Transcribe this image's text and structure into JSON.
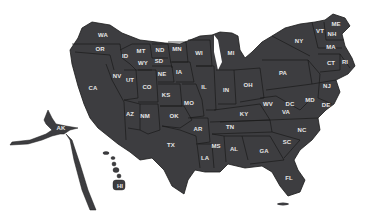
{
  "map": {
    "type": "cartogram",
    "region": "United States",
    "colors": {
      "state_fill": "#3d3d40",
      "border": "#1a1a1a",
      "label": "#e6e6e6",
      "background": "#ffffff"
    },
    "states": [
      {
        "abbr": "WA",
        "x": 103,
        "y": 35
      },
      {
        "abbr": "OR",
        "x": 100,
        "y": 49
      },
      {
        "abbr": "CA",
        "x": 93,
        "y": 88
      },
      {
        "abbr": "NV",
        "x": 117,
        "y": 76
      },
      {
        "abbr": "ID",
        "x": 125,
        "y": 56
      },
      {
        "abbr": "MT",
        "x": 141,
        "y": 51
      },
      {
        "abbr": "WY",
        "x": 143,
        "y": 63
      },
      {
        "abbr": "UT",
        "x": 130,
        "y": 80
      },
      {
        "abbr": "CO",
        "x": 147,
        "y": 87
      },
      {
        "abbr": "AZ",
        "x": 130,
        "y": 114
      },
      {
        "abbr": "NM",
        "x": 145,
        "y": 116
      },
      {
        "abbr": "ND",
        "x": 160,
        "y": 50
      },
      {
        "abbr": "SD",
        "x": 159,
        "y": 61
      },
      {
        "abbr": "NE",
        "x": 162,
        "y": 74
      },
      {
        "abbr": "KS",
        "x": 166,
        "y": 95
      },
      {
        "abbr": "OK",
        "x": 174,
        "y": 116
      },
      {
        "abbr": "TX",
        "x": 171,
        "y": 145
      },
      {
        "abbr": "MN",
        "x": 177,
        "y": 49
      },
      {
        "abbr": "IA",
        "x": 179,
        "y": 72
      },
      {
        "abbr": "MO",
        "x": 189,
        "y": 103
      },
      {
        "abbr": "AR",
        "x": 198,
        "y": 129
      },
      {
        "abbr": "LA",
        "x": 205,
        "y": 158
      },
      {
        "abbr": "WI",
        "x": 199,
        "y": 53
      },
      {
        "abbr": "IL",
        "x": 204,
        "y": 87
      },
      {
        "abbr": "MI",
        "x": 231,
        "y": 53
      },
      {
        "abbr": "IN",
        "x": 226,
        "y": 90
      },
      {
        "abbr": "OH",
        "x": 248,
        "y": 85
      },
      {
        "abbr": "KY",
        "x": 244,
        "y": 114
      },
      {
        "abbr": "TN",
        "x": 230,
        "y": 127
      },
      {
        "abbr": "MS",
        "x": 216,
        "y": 146
      },
      {
        "abbr": "AL",
        "x": 234,
        "y": 149
      },
      {
        "abbr": "GA",
        "x": 264,
        "y": 151
      },
      {
        "abbr": "FL",
        "x": 289,
        "y": 178
      },
      {
        "abbr": "SC",
        "x": 287,
        "y": 142
      },
      {
        "abbr": "NC",
        "x": 302,
        "y": 130
      },
      {
        "abbr": "VA",
        "x": 286,
        "y": 112
      },
      {
        "abbr": "WV",
        "x": 268,
        "y": 104
      },
      {
        "abbr": "DC",
        "x": 290,
        "y": 104
      },
      {
        "abbr": "MD",
        "x": 310,
        "y": 100
      },
      {
        "abbr": "DE",
        "x": 326,
        "y": 105
      },
      {
        "abbr": "PA",
        "x": 283,
        "y": 73
      },
      {
        "abbr": "NJ",
        "x": 327,
        "y": 86
      },
      {
        "abbr": "NY",
        "x": 299,
        "y": 41
      },
      {
        "abbr": "VT",
        "x": 320,
        "y": 31
      },
      {
        "abbr": "NH",
        "x": 332,
        "y": 34
      },
      {
        "abbr": "ME",
        "x": 336,
        "y": 24
      },
      {
        "abbr": "MA",
        "x": 331,
        "y": 47
      },
      {
        "abbr": "CT",
        "x": 331,
        "y": 63
      },
      {
        "abbr": "RI",
        "x": 345,
        "y": 62
      },
      {
        "abbr": "AK",
        "x": 61,
        "y": 128
      },
      {
        "abbr": "HI",
        "x": 120,
        "y": 186
      }
    ]
  }
}
